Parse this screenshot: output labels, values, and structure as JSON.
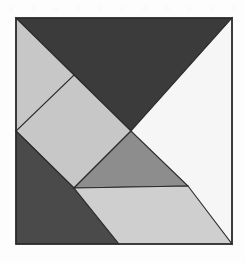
{
  "app": {
    "title": "Tangram Puzzle",
    "canvas_width": 245,
    "canvas_height": 263,
    "background_color": "#fdfdfd"
  },
  "watermark": {
    "glyph": "●",
    "count": 11,
    "color": "#fafafa",
    "description": "faint repeated watermark marks along top edge"
  },
  "figure": {
    "name": "tangram-square",
    "shape": "square",
    "outline_color": "#2b2b2b",
    "bounds": {
      "x": 16,
      "y": 18,
      "width": 216,
      "height": 226
    },
    "piece_count": 7
  },
  "palette": {
    "charcoal": "#3b3b3b",
    "dark_gray": "#4a4a4a",
    "medium_gray": "#8d8d8d",
    "light_gray": "#c7c7c7",
    "pale_gray": "#cfcfcf",
    "off_white": "#f6f6f6",
    "outline": "#2b2b2b"
  },
  "chart_data": {
    "type": "diagram",
    "shape": "square",
    "pieces": [
      {
        "id": "large-triangle-top",
        "label": "Large triangle (top)",
        "color": "#3b3b3b",
        "points": "16,18 232,18 131,131"
      },
      {
        "id": "large-triangle-right",
        "label": "Large triangle (right)",
        "color": "#f6f6f6",
        "points": "232,18 232,244 131,131"
      },
      {
        "id": "parallelogram-upper-left",
        "label": "Parallelogram (upper left)",
        "color": "#c7c7c7",
        "points": "16,18 74,75 74,131 16,131"
      },
      {
        "id": "medium-square-left",
        "label": "Square (middle left)",
        "color": "#c7c7c7",
        "points": "74,75 131,131 74,188 16,131"
      },
      {
        "id": "small-triangle-lower-left",
        "label": "Small triangle (lower left)",
        "color": "#4a4a4a",
        "points": "16,131 74,188 119,244 16,244"
      },
      {
        "id": "medium-triangle-center",
        "label": "Medium triangle (center)",
        "color": "#8d8d8d",
        "points": "74,188 131,131 188,186"
      },
      {
        "id": "parallelogram-bottom",
        "label": "Parallelogram (bottom)",
        "color": "#cfcfcf",
        "points": "74,188 188,186 232,244 119,244"
      }
    ],
    "vertices": {
      "top_left": [
        16,
        18
      ],
      "top_right": [
        232,
        18
      ],
      "bottom_left": [
        16,
        244
      ],
      "bottom_right": [
        232,
        244
      ],
      "center": [
        131,
        131
      ],
      "left_mid": [
        16,
        131
      ],
      "upper_inner": [
        74,
        75
      ],
      "lower_inner": [
        74,
        188
      ],
      "right_inner": [
        188,
        186
      ],
      "bottom_mid": [
        119,
        244
      ]
    }
  }
}
